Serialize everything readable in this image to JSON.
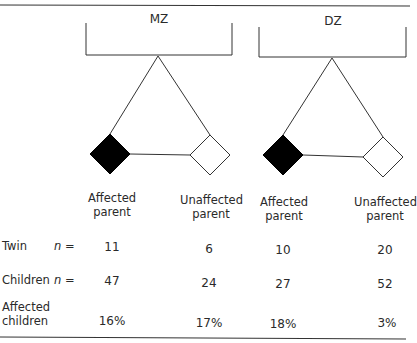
{
  "groups": [
    {
      "label": "MZ",
      "affected_label": "Affected parent",
      "unaffected_label": "Unaffected parent"
    },
    {
      "label": "DZ",
      "affected_label": "Affected parent",
      "unaffected_label": "Unaffected parent"
    }
  ],
  "columns": {
    "mz_affected": {
      "line1": "Affected",
      "line2": "parent"
    },
    "mz_unaffected": {
      "line1": "Unaffected",
      "line2": "parent"
    },
    "dz_affected": {
      "line1": "Affected",
      "line2": "parent"
    },
    "dz_unaffected": {
      "line1": "Unaffected",
      "line2": "parent"
    }
  },
  "rows": {
    "twin": {
      "label": "Twin",
      "n_label": "n =",
      "values": [
        "11",
        "6",
        "10",
        "20"
      ]
    },
    "children": {
      "label": "Children",
      "n_label": "n =",
      "values": [
        "47",
        "24",
        "27",
        "52"
      ]
    },
    "affected_children": {
      "label_line1": "Affected",
      "label_line2": "children",
      "values": [
        "16%",
        "17%",
        "18%",
        "3%"
      ]
    }
  },
  "symbols": {
    "affected": {
      "shape": "diamond",
      "fill": "#000000"
    },
    "unaffected": {
      "shape": "diamond",
      "fill": "#ffffff"
    }
  },
  "colors": {
    "line": "#333333",
    "text": "#2a2a2a"
  }
}
